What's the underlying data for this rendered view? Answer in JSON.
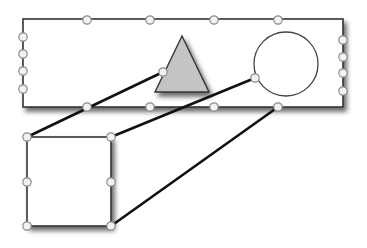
{
  "diagram": {
    "colors": {
      "background": "#ffffff",
      "outline": "#333333",
      "triangle_fill": "#c4c4c4",
      "handle_fill": "#f2f2f2",
      "handle_stroke": "#8a8a8a",
      "connector": "#111111",
      "shadow": "#555555"
    },
    "shapes": [
      {
        "id": "container-rectangle",
        "kind": "rectangle",
        "handles": 16
      },
      {
        "id": "triangle",
        "kind": "triangle",
        "handles": 1
      },
      {
        "id": "circle",
        "kind": "circle",
        "handles": 1
      },
      {
        "id": "square",
        "kind": "square",
        "handles": 6
      }
    ],
    "connectors": [
      {
        "from": "triangle-handle",
        "to": "square-top-left"
      },
      {
        "from": "circle-handle",
        "to": "square-top-right"
      },
      {
        "from": "rectangle-bottom-handle-4",
        "to": "square-bottom-right"
      }
    ]
  }
}
